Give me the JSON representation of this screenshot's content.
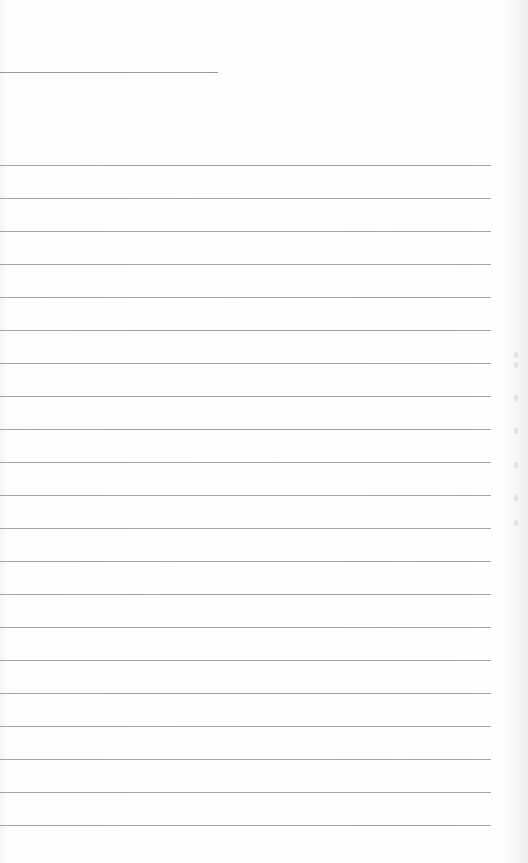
{
  "document": {
    "type": "lined-paper",
    "header_line": {
      "x": 0,
      "y": 72,
      "width": 218
    },
    "rules": {
      "count": 21,
      "start_y": 165,
      "spacing": 33,
      "width": 491,
      "color": "#a4a4a4"
    },
    "background_color": "#fdfdfd"
  }
}
